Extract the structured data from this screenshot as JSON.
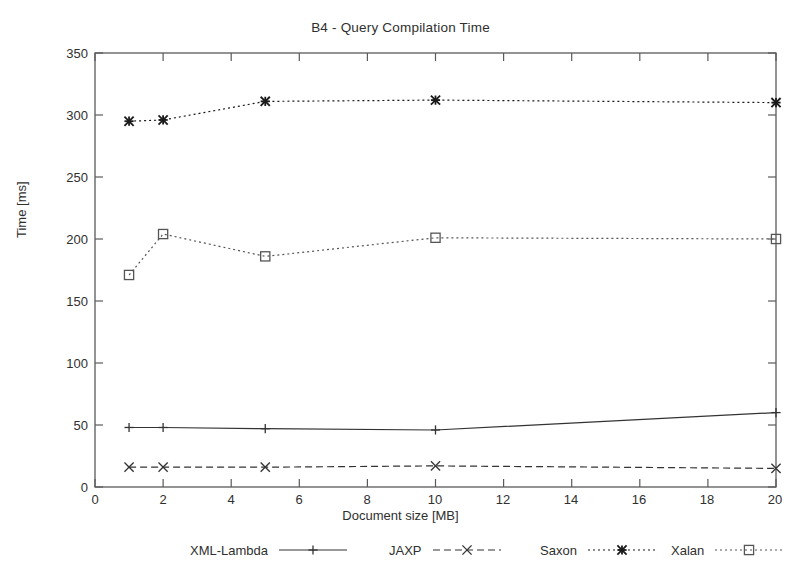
{
  "chart_data": {
    "type": "line",
    "title": "B4 - Query Compilation Time",
    "xlabel": "Document size [MB]",
    "ylabel": "Time [ms]",
    "xlim": [
      0,
      20
    ],
    "ylim": [
      0,
      350
    ],
    "xticks": [
      0,
      2,
      4,
      6,
      8,
      10,
      12,
      14,
      16,
      18,
      20
    ],
    "yticks": [
      0,
      50,
      100,
      150,
      200,
      250,
      300,
      350
    ],
    "grid": false,
    "legend_position": "bottom",
    "x": [
      1,
      2,
      5,
      10,
      20
    ],
    "series": [
      {
        "name": "XML-Lambda",
        "values": [
          48,
          48,
          47,
          46,
          60
        ],
        "line_style": "solid",
        "marker": "plus",
        "color": "#333333"
      },
      {
        "name": "JAXP",
        "values": [
          16,
          16,
          16,
          17,
          15
        ],
        "line_style": "dashed",
        "marker": "cross",
        "color": "#333333"
      },
      {
        "name": "Saxon",
        "values": [
          295,
          296,
          311,
          312,
          310
        ],
        "line_style": "dotted",
        "marker": "asterisk",
        "color": "#1a1a1a"
      },
      {
        "name": "Xalan",
        "values": [
          171,
          204,
          186,
          201,
          200
        ],
        "line_style": "dotted",
        "marker": "square",
        "color": "#555555"
      }
    ]
  },
  "axis": {
    "x_tick_labels": [
      "0",
      "2",
      "4",
      "6",
      "8",
      "10",
      "12",
      "14",
      "16",
      "18",
      "20"
    ],
    "y_tick_labels": [
      "0",
      "50",
      "100",
      "150",
      "200",
      "250",
      "300",
      "350"
    ]
  },
  "legend": {
    "items": [
      {
        "label": "XML-Lambda"
      },
      {
        "label": "JAXP"
      },
      {
        "label": "Saxon"
      },
      {
        "label": "Xalan"
      }
    ]
  }
}
